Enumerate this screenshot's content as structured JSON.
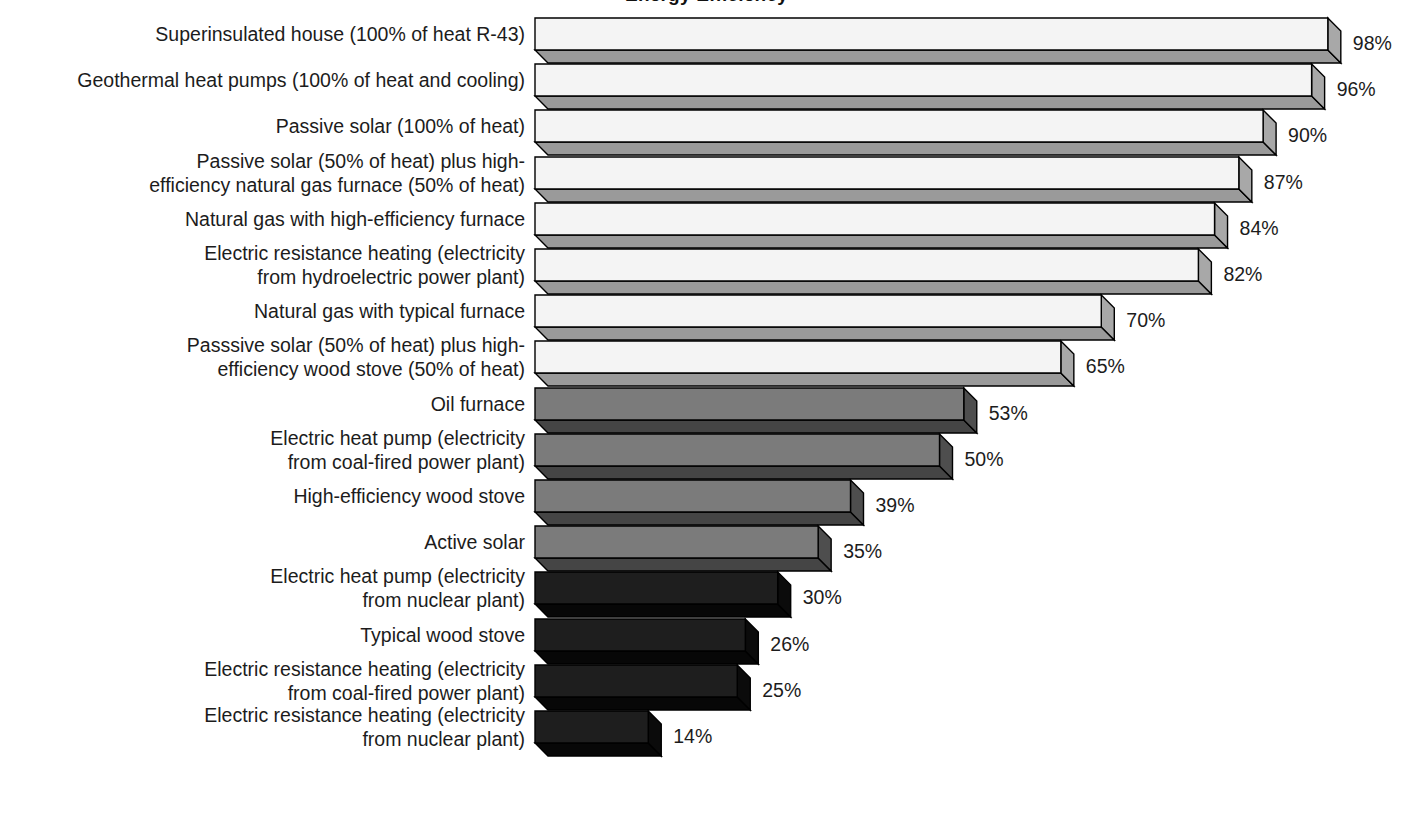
{
  "chart_data": {
    "type": "bar",
    "orientation": "horizontal",
    "style": "3d-extruded-bars",
    "title": "Energy Efficiency",
    "xlabel": "",
    "ylabel": "",
    "xlim": [
      0,
      100
    ],
    "grid": false,
    "legend": null,
    "value_suffix": "%",
    "categories": [
      "Superinsulated house (100% of heat R-43)",
      "Geothermal heat pumps (100% of heat and cooling)",
      "Passive solar (100% of heat)",
      "Passive solar (50% of heat) plus high-\nefficiency natural gas furnace (50% of heat)",
      "Natural gas with high-efficiency furnace",
      "Electric resistance heating (electricity\nfrom hydroelectric power plant)",
      "Natural gas with typical furnace",
      "Passsive solar (50% of heat) plus high-\nefficiency wood stove (50% of heat)",
      "Oil furnace",
      "Electric heat pump (electricity\nfrom coal-fired power plant)",
      "High-efficiency wood stove",
      "Active solar",
      "Electric heat pump (electricity\nfrom nuclear plant)",
      "Typical wood stove",
      "Electric resistance heating (electricity\nfrom coal-fired power plant)",
      "Electric resistance heating (electricity\nfrom nuclear plant)"
    ],
    "values": [
      98,
      96,
      90,
      87,
      84,
      82,
      70,
      65,
      53,
      50,
      39,
      35,
      30,
      26,
      25,
      14
    ],
    "value_labels": [
      "98%",
      "96%",
      "90%",
      "87%",
      "84%",
      "82%",
      "70%",
      "65%",
      "53%",
      "50%",
      "39%",
      "35%",
      "30%",
      "26%",
      "25%",
      "14%"
    ],
    "bars": [
      {
        "label": "Superinsulated house (100% of heat R-43)",
        "value": 98,
        "value_label": "98%",
        "tone": "light",
        "lines": 1
      },
      {
        "label": "Geothermal heat pumps (100% of heat and cooling)",
        "value": 96,
        "value_label": "96%",
        "tone": "light",
        "lines": 1
      },
      {
        "label": "Passive solar (100% of heat)",
        "value": 90,
        "value_label": "90%",
        "tone": "light",
        "lines": 1
      },
      {
        "label": "Passive solar (50% of heat) plus high-\nefficiency natural gas furnace (50% of heat)",
        "value": 87,
        "value_label": "87%",
        "tone": "light",
        "lines": 2
      },
      {
        "label": "Natural gas with high-efficiency furnace",
        "value": 84,
        "value_label": "84%",
        "tone": "light",
        "lines": 1
      },
      {
        "label": "Electric resistance heating (electricity\nfrom hydroelectric power plant)",
        "value": 82,
        "value_label": "82%",
        "tone": "light",
        "lines": 2
      },
      {
        "label": "Natural gas with typical furnace",
        "value": 70,
        "value_label": "70%",
        "tone": "light",
        "lines": 1
      },
      {
        "label": "Passsive solar (50% of heat) plus high-\nefficiency wood stove (50% of heat)",
        "value": 65,
        "value_label": "65%",
        "tone": "light",
        "lines": 2
      },
      {
        "label": "Oil furnace",
        "value": 53,
        "value_label": "53%",
        "tone": "mid",
        "lines": 1
      },
      {
        "label": "Electric heat pump (electricity\nfrom coal-fired power plant)",
        "value": 50,
        "value_label": "50%",
        "tone": "mid",
        "lines": 2
      },
      {
        "label": "High-efficiency wood stove",
        "value": 39,
        "value_label": "39%",
        "tone": "mid",
        "lines": 1
      },
      {
        "label": "Active solar",
        "value": 35,
        "value_label": "35%",
        "tone": "mid",
        "lines": 1
      },
      {
        "label": "Electric heat pump (electricity\nfrom nuclear plant)",
        "value": 30,
        "value_label": "30%",
        "tone": "dark",
        "lines": 2
      },
      {
        "label": "Typical wood stove",
        "value": 26,
        "value_label": "26%",
        "tone": "dark",
        "lines": 1
      },
      {
        "label": "Electric resistance heating (electricity\nfrom coal-fired power plant)",
        "value": 25,
        "value_label": "25%",
        "tone": "dark",
        "lines": 2
      },
      {
        "label": "Electric resistance heating (electricity\nfrom nuclear plant)",
        "value": 14,
        "value_label": "14%",
        "tone": "dark",
        "lines": 2
      }
    ]
  },
  "colors": {
    "background": "#ffffff",
    "text": "#1c1c1c",
    "outline": "#000000",
    "light_face": "#f4f4f4",
    "light_side": "#a8a8a8",
    "light_bottom": "#9a9a9a",
    "mid_face": "#7b7b7b",
    "mid_side": "#4e4e4e",
    "mid_bottom": "#454545",
    "dark_face": "#1e1e1e",
    "dark_side": "#0b0b0b",
    "dark_bottom": "#070707"
  },
  "geometry": {
    "bar_origin_x": 535,
    "px_per_percent": 8.09,
    "row_height": 46.2,
    "first_row_top": 18,
    "face_height": 32,
    "depth_x": 13,
    "depth_y": 13,
    "label_right_edge": 525
  }
}
